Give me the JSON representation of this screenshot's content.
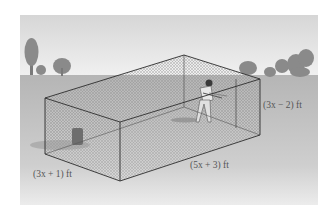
{
  "figure": {
    "labels": {
      "height": "(3x − 2) ft",
      "width": "(3x + 1) ft",
      "length": "(5x + 3) ft"
    },
    "colors": {
      "sky_top": "#d9d9d9",
      "sky_bottom": "#efefef",
      "ground": "#b9b9b9",
      "ground_light": "#dcdcdc",
      "trees": "#8f8f8f",
      "edges": "#333333",
      "net": "#9a9a9a"
    }
  }
}
